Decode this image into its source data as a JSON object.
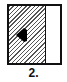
{
  "figure": {
    "label": "2.",
    "panel": {
      "hatched_region": "left",
      "hatched_fraction": 0.65,
      "arrow_direction": "left",
      "colors": {
        "border": "#111111",
        "hatch": "#555555",
        "background": "#ffffff"
      }
    }
  }
}
